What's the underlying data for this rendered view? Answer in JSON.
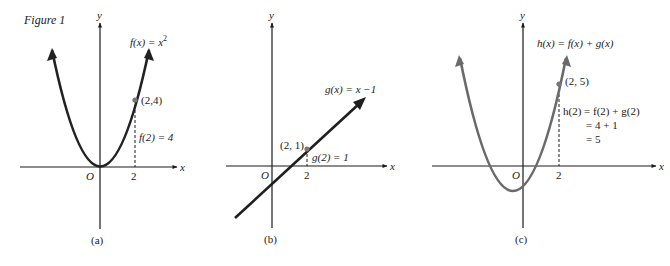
{
  "figure_title": "Figure 1",
  "colors": {
    "axis": "#1a1a1a",
    "curve_f": "#222222",
    "curve_g": "#1f1f1f",
    "curve_h": "#6a6a6a",
    "text": "#1a1a1a"
  },
  "panels": [
    {
      "id": "a",
      "caption": "(a)",
      "x_axis_label": "x",
      "y_axis_label": "y",
      "origin_label": "O",
      "tick_label": "2",
      "function_label": "f(x) = x",
      "function_exponent": "2",
      "point_label": "(2,4)",
      "value_label": "f(2) = 4"
    },
    {
      "id": "b",
      "caption": "(b)",
      "x_axis_label": "x",
      "y_axis_label": "y",
      "origin_label": "O",
      "tick_label": "2",
      "function_label": "g(x) = x −1",
      "point_label": "(2, 1)",
      "value_label": "g(2) = 1"
    },
    {
      "id": "c",
      "caption": "(c)",
      "x_axis_label": "x",
      "y_axis_label": "y",
      "origin_label": "O",
      "tick_label": "2",
      "function_label": "h(x) = f(x) + g(x)",
      "point_label": "(2, 5)",
      "value_lines": [
        "h(2) = f(2) + g(2)",
        "= 4 + 1",
        "= 5"
      ]
    }
  ]
}
